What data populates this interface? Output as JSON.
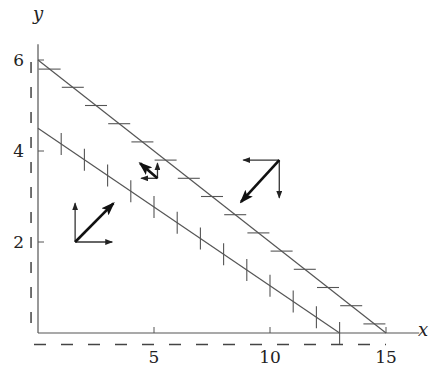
{
  "chart_data": {
    "type": "line",
    "title": "",
    "xlabel": "x",
    "ylabel": "y",
    "xlim": [
      0,
      16
    ],
    "ylim": [
      0,
      6.3
    ],
    "xticks": [
      5,
      10,
      15
    ],
    "yticks": [
      2,
      4,
      6
    ],
    "grid": false,
    "series": [
      {
        "name": "upper-line",
        "x": [
          0,
          15
        ],
        "y": [
          6,
          0
        ],
        "tick_style": "horizontal",
        "tick_x": [
          0.5,
          1.5,
          2.5,
          3.5,
          4.5,
          5.5,
          6.5,
          7.5,
          8.5,
          9.5,
          10.5,
          11.5,
          12.5,
          13.5,
          14.5
        ]
      },
      {
        "name": "lower-line",
        "x": [
          0,
          13
        ],
        "y": [
          4.5,
          0
        ],
        "tick_style": "vertical",
        "tick_x": [
          1,
          2,
          3,
          4,
          5,
          6,
          7,
          8,
          9,
          10,
          11,
          12,
          13
        ]
      }
    ],
    "dashed_guides": [
      {
        "name": "dashed-horizontal",
        "y": -0.25,
        "x_range": [
          0,
          15
        ]
      },
      {
        "name": "dashed-vertical",
        "x": -0.3,
        "y_range": [
          0,
          6
        ]
      }
    ],
    "vector_groups": [
      {
        "name": "vectors-left",
        "origin": [
          1.6,
          2.0
        ],
        "vectors": [
          {
            "kind": "thin",
            "dx": 0,
            "dy": 0.85
          },
          {
            "kind": "thin",
            "dx": 1.6,
            "dy": 0
          },
          {
            "kind": "thick",
            "dx": 1.65,
            "dy": 0.85
          }
        ]
      },
      {
        "name": "vectors-middle",
        "origin": [
          5.15,
          3.4
        ],
        "vectors": [
          {
            "kind": "thin",
            "dx": 0,
            "dy": 0.33
          },
          {
            "kind": "thin",
            "dx": -0.7,
            "dy": 0
          },
          {
            "kind": "thick",
            "dx": -0.75,
            "dy": 0.33
          }
        ]
      },
      {
        "name": "vectors-right",
        "origin": [
          10.4,
          3.8
        ],
        "vectors": [
          {
            "kind": "thin",
            "dx": -1.55,
            "dy": 0
          },
          {
            "kind": "thin",
            "dx": 0,
            "dy": -0.83
          },
          {
            "kind": "thick",
            "dx": -1.65,
            "dy": -0.92
          }
        ]
      }
    ]
  }
}
